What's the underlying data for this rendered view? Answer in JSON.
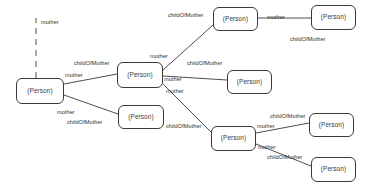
{
  "diagram": {
    "node_label": "(Person)",
    "stroke_color": "#3a3a3a",
    "text_color": "#2e2e2e",
    "background": "#ffffff",
    "width": 379,
    "height": 194,
    "nodes": [
      {
        "id": "n1",
        "label": "(Person)",
        "x": 16,
        "y": 78,
        "w": 48,
        "h": 26
      },
      {
        "id": "n2",
        "label": "(Person)",
        "x": 117,
        "y": 62,
        "w": 46,
        "h": 26
      },
      {
        "id": "n3",
        "label": "(Person)",
        "x": 118,
        "y": 105,
        "w": 46,
        "h": 24
      },
      {
        "id": "n4",
        "label": "(Person)",
        "x": 213,
        "y": 7,
        "w": 45,
        "h": 24
      },
      {
        "id": "n5",
        "label": "(Person)",
        "x": 311,
        "y": 5,
        "w": 45,
        "h": 25
      },
      {
        "id": "n6",
        "label": "(Person)",
        "x": 227,
        "y": 70,
        "w": 45,
        "h": 24
      },
      {
        "id": "n7",
        "label": "(Person)",
        "x": 211,
        "y": 126,
        "w": 45,
        "h": 25
      },
      {
        "id": "n8",
        "label": "(Person)",
        "x": 309,
        "y": 113,
        "w": 45,
        "h": 24
      },
      {
        "id": "n9",
        "label": "(Person)",
        "x": 311,
        "y": 157,
        "w": 45,
        "h": 25
      }
    ],
    "edges": [
      {
        "id": "e0",
        "kind": "dashed",
        "x1": 36,
        "y1": 78,
        "x2": 36,
        "y2": 18
      },
      {
        "id": "e1",
        "kind": "solid",
        "x1": 64,
        "y1": 84,
        "x2": 117,
        "y2": 74
      },
      {
        "id": "e2",
        "kind": "solid",
        "x1": 64,
        "y1": 95,
        "x2": 118,
        "y2": 114
      },
      {
        "id": "e3",
        "kind": "solid",
        "x1": 163,
        "y1": 70,
        "x2": 213,
        "y2": 25
      },
      {
        "id": "e4",
        "kind": "solid",
        "x1": 163,
        "y1": 76,
        "x2": 227,
        "y2": 80
      },
      {
        "id": "e5",
        "kind": "solid",
        "x1": 163,
        "y1": 84,
        "x2": 211,
        "y2": 132
      },
      {
        "id": "e6",
        "kind": "solid",
        "x1": 258,
        "y1": 18,
        "x2": 311,
        "y2": 18
      },
      {
        "id": "e7",
        "kind": "solid",
        "x1": 256,
        "y1": 133,
        "x2": 309,
        "y2": 123
      },
      {
        "id": "e8",
        "kind": "solid",
        "x1": 256,
        "y1": 144,
        "x2": 311,
        "y2": 166
      }
    ],
    "labels": [
      {
        "id": "l0",
        "text": "mother",
        "x": 41,
        "y": 20
      },
      {
        "id": "l1",
        "text": "childOfMother",
        "x": 74,
        "y": 61
      },
      {
        "id": "l2",
        "text": "mother",
        "x": 65,
        "y": 73
      },
      {
        "id": "l3",
        "text": "mother",
        "x": 57,
        "y": 110
      },
      {
        "id": "l4",
        "text": "childOfMother",
        "x": 67,
        "y": 120
      },
      {
        "id": "l5",
        "text": "mother",
        "x": 150,
        "y": 54
      },
      {
        "id": "l6",
        "text": "childOfMother",
        "x": 168,
        "y": 13
      },
      {
        "id": "l7",
        "text": "childOfMother",
        "x": 187,
        "y": 61
      },
      {
        "id": "l8",
        "text": "mother",
        "x": 164,
        "y": 77
      },
      {
        "id": "l9",
        "text": "mother",
        "x": 166,
        "y": 89
      },
      {
        "id": "l10",
        "text": "mother",
        "x": 267,
        "y": 15
      },
      {
        "id": "l11",
        "text": "childOfMother",
        "x": 290,
        "y": 37
      },
      {
        "id": "l12",
        "text": "childOfMother",
        "x": 166,
        "y": 124
      },
      {
        "id": "l13",
        "text": "mother",
        "x": 257,
        "y": 124
      },
      {
        "id": "l14",
        "text": "childOfMother",
        "x": 270,
        "y": 114
      },
      {
        "id": "l15",
        "text": "mother",
        "x": 258,
        "y": 145
      },
      {
        "id": "l16",
        "text": "childOfMother",
        "x": 267,
        "y": 155
      }
    ]
  }
}
